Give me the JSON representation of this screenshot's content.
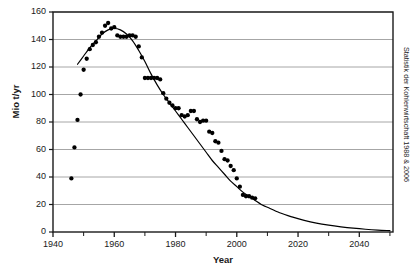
{
  "chart_data": {
    "type": "scatter",
    "title": "",
    "xlabel": "Year",
    "ylabel": "Mio t/yr",
    "xlim": [
      1940,
      2051
    ],
    "ylim": [
      0,
      160
    ],
    "grid": true,
    "grid_axis": "y",
    "legend": null,
    "xticks": [
      1940,
      1960,
      1980,
      2000,
      2020,
      2040
    ],
    "xticks_minor": [
      1950,
      1970,
      1990,
      2010,
      2030,
      2050
    ],
    "yticks": [
      0,
      20,
      40,
      60,
      80,
      100,
      120,
      140,
      160
    ],
    "annotations": [
      {
        "name": "source-note",
        "text": "Statistik der Kohlenwirtschaft 1988 & 2006",
        "position": "right-outside-vertical"
      }
    ],
    "series": [
      {
        "name": "observed-production",
        "type": "scatter",
        "marker": "circle",
        "color": "#000000",
        "points": [
          [
            1946,
            39
          ],
          [
            1947,
            61.5
          ],
          [
            1948,
            81.5
          ],
          [
            1949,
            100
          ],
          [
            1950,
            118
          ],
          [
            1951,
            126
          ],
          [
            1952,
            133
          ],
          [
            1953,
            136
          ],
          [
            1954,
            138
          ],
          [
            1955,
            142
          ],
          [
            1956,
            145
          ],
          [
            1957,
            150
          ],
          [
            1958,
            152
          ],
          [
            1959,
            148
          ],
          [
            1960,
            149
          ],
          [
            1961,
            143
          ],
          [
            1962,
            142
          ],
          [
            1963,
            142
          ],
          [
            1964,
            142
          ],
          [
            1965,
            143
          ],
          [
            1966,
            143
          ],
          [
            1967,
            142
          ],
          [
            1968,
            135
          ],
          [
            1969,
            127
          ],
          [
            1970,
            112
          ],
          [
            1971,
            112
          ],
          [
            1972,
            112
          ],
          [
            1973,
            112
          ],
          [
            1974,
            112
          ],
          [
            1975,
            111
          ],
          [
            1976,
            101
          ],
          [
            1977,
            97
          ],
          [
            1978,
            94
          ],
          [
            1979,
            92
          ],
          [
            1980,
            90
          ],
          [
            1981,
            90
          ],
          [
            1982,
            85
          ],
          [
            1983,
            84
          ],
          [
            1984,
            85
          ],
          [
            1985,
            88
          ],
          [
            1986,
            88
          ],
          [
            1987,
            82
          ],
          [
            1988,
            80
          ],
          [
            1989,
            81
          ],
          [
            1990,
            81
          ],
          [
            1991,
            73
          ],
          [
            1992,
            72
          ],
          [
            1993,
            66
          ],
          [
            1994,
            65
          ],
          [
            1995,
            59
          ],
          [
            1996,
            53
          ],
          [
            1997,
            52
          ],
          [
            1998,
            48
          ],
          [
            1999,
            45
          ],
          [
            2000,
            39
          ],
          [
            2001,
            33
          ],
          [
            2002,
            27
          ],
          [
            2003,
            26
          ],
          [
            2004,
            26
          ],
          [
            2005,
            25
          ],
          [
            2006,
            24.5
          ]
        ]
      },
      {
        "name": "fitted-curve",
        "type": "line",
        "color": "#000000",
        "points": [
          [
            1948,
            122
          ],
          [
            1950,
            128
          ],
          [
            1952,
            134
          ],
          [
            1954,
            139
          ],
          [
            1956,
            144
          ],
          [
            1958,
            147
          ],
          [
            1960,
            148
          ],
          [
            1962,
            147
          ],
          [
            1964,
            144
          ],
          [
            1966,
            139
          ],
          [
            1968,
            132
          ],
          [
            1970,
            124
          ],
          [
            1972,
            115
          ],
          [
            1974,
            107
          ],
          [
            1976,
            100
          ],
          [
            1978,
            94
          ],
          [
            1980,
            88
          ],
          [
            1982,
            82
          ],
          [
            1984,
            76
          ],
          [
            1986,
            70
          ],
          [
            1988,
            64
          ],
          [
            1990,
            58
          ],
          [
            1992,
            52
          ],
          [
            1994,
            47
          ],
          [
            1996,
            42
          ],
          [
            1998,
            37
          ],
          [
            2000,
            33
          ],
          [
            2002,
            29
          ],
          [
            2004,
            26
          ],
          [
            2006,
            23
          ],
          [
            2008,
            20
          ],
          [
            2010,
            18
          ],
          [
            2014,
            14
          ],
          [
            2018,
            11
          ],
          [
            2022,
            8.5
          ],
          [
            2026,
            6.5
          ],
          [
            2030,
            5
          ],
          [
            2034,
            3.8
          ],
          [
            2038,
            2.8
          ],
          [
            2042,
            2
          ],
          [
            2046,
            1.4
          ],
          [
            2050,
            1
          ]
        ]
      }
    ]
  },
  "axes": {
    "ylabel": "Mio t/yr",
    "xlabel": "Year",
    "ytick_labels": [
      "160",
      "140",
      "120",
      "100",
      "80",
      "60",
      "40",
      "20",
      "0"
    ],
    "xtick_labels": [
      "1940",
      "1960",
      "1980",
      "2000",
      "2020",
      "2040"
    ]
  },
  "source": {
    "text": "Statistik der Kohlenwirtschaft 1988 & 2006"
  },
  "colors": {
    "marker": "#000000",
    "curve": "#000000",
    "grid": "#8f8f8f",
    "frame": "#1a1a1a",
    "background": "#ffffff"
  }
}
